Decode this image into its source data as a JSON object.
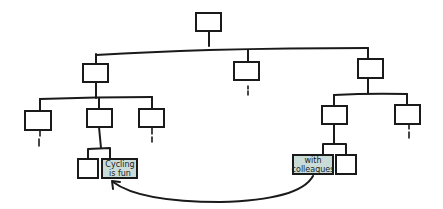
{
  "diagram": {
    "type": "tree",
    "style": "hand-drawn",
    "highlight_fill": "#c9dcd8",
    "nodes": [
      {
        "id": "root",
        "label": ""
      },
      {
        "id": "l1-left",
        "label": ""
      },
      {
        "id": "l1-mid",
        "label": ""
      },
      {
        "id": "l1-right",
        "label": ""
      },
      {
        "id": "l2-left-a",
        "label": ""
      },
      {
        "id": "l2-left-b",
        "label": ""
      },
      {
        "id": "l2-left-c",
        "label": ""
      },
      {
        "id": "l2-right-a",
        "label": ""
      },
      {
        "id": "l2-right-b",
        "label": ""
      },
      {
        "id": "l3-left-a",
        "label": ""
      },
      {
        "id": "l3-left-b",
        "label": "Cycling is fun",
        "lines": [
          "Cycling",
          "is fun"
        ],
        "highlighted": true
      },
      {
        "id": "l3-right-a",
        "label": "with colleagues",
        "lines": [
          "with",
          "colleagues"
        ],
        "highlighted": true
      },
      {
        "id": "l3-right-b",
        "label": ""
      }
    ],
    "edges": [
      [
        "root",
        "l1-left"
      ],
      [
        "root",
        "l1-mid"
      ],
      [
        "root",
        "l1-right"
      ],
      [
        "l1-left",
        "l2-left-a"
      ],
      [
        "l1-left",
        "l2-left-b"
      ],
      [
        "l1-left",
        "l2-left-c"
      ],
      [
        "l1-right",
        "l2-right-a"
      ],
      [
        "l1-right",
        "l2-right-b"
      ],
      [
        "l2-left-b",
        "l3-left-a"
      ],
      [
        "l2-left-b",
        "l3-left-b"
      ],
      [
        "l2-right-a",
        "l3-right-a"
      ],
      [
        "l2-right-a",
        "l3-right-b"
      ]
    ],
    "link": {
      "from": "l3-right-a",
      "to": "l3-left-b",
      "kind": "curved-arrow"
    }
  }
}
